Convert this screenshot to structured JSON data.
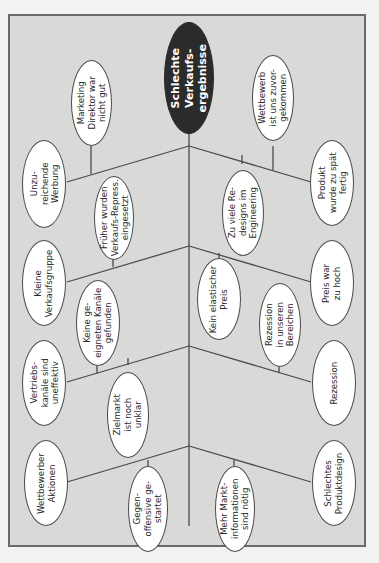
{
  "diagram": {
    "type": "fishbone",
    "orientation": "rotated-90",
    "colors": {
      "frame_fill": "#d9d9d7",
      "frame_border": "#6a6a6a",
      "node_fill": "#ffffff",
      "head_fill": "#2b2b2b",
      "line": "#4a4a4a"
    },
    "head": {
      "label": "Schlechte\nVerkaufs-\nergebnisse"
    },
    "branches": [
      {
        "side": "left",
        "cause": "Unzu-\nreichende\nWerbung",
        "sub_causes": [
          "Marketing\nDirektor war\nnicht gut",
          "Früher wurden\nVerkaufs-Repress.\neingesetzt"
        ]
      },
      {
        "side": "left",
        "cause": "Kleine\nVerkaufsgruppe",
        "sub_causes": [
          "Keine ge-\neigneten Kanäle\ngefunden"
        ]
      },
      {
        "side": "left",
        "cause": "Vertriebs-\nkanäle sind\nuneffektiv",
        "sub_causes": [
          "Keine ge-\neigneten Kanäle\ngefunden",
          "Zielmarkt\nist noch\nunklar"
        ]
      },
      {
        "side": "left",
        "cause": "Wettbewerber\nAktionen",
        "sub_causes": [
          "Gegen-\noffensive ge-\nstartet"
        ]
      },
      {
        "side": "right",
        "cause": "Produkt\nwurde zu spät\nfertig",
        "sub_causes": [
          "Wettbewerb\nist uns zuvor-\ngekommen",
          "Zu viele Re-\ndesigns im\nEngineering"
        ]
      },
      {
        "side": "right",
        "cause": "Preis war\nzu hoch",
        "sub_causes": [
          "Kein elastischer\nPreis"
        ]
      },
      {
        "side": "right",
        "cause": "Rezession",
        "sub_causes": [
          "Rezession\nin unseren\nBereichen"
        ]
      },
      {
        "side": "right",
        "cause": "Schlechtes\nProduktdesign",
        "sub_causes": [
          "Mehr Markt-\ninformationen\nsind nötig"
        ]
      }
    ],
    "nodes": {
      "head": "Schlechte\nVerkaufs-\nergebnisse",
      "unzureichende_werbung": "Unzu-\nreichende\nWerbung",
      "marketing_direktor": "Marketing\nDirektor war\nnicht gut",
      "frueher_verkaufs_repress": "Früher wurden\nVerkaufs-Repress.\neingesetzt",
      "kleine_verkaufsgruppe": "Kleine\nVerkaufsgruppe",
      "keine_kanaele": "Keine ge-\neigneten Kanäle\ngefunden",
      "vertriebskanaele": "Vertriebs-\nkanäle sind\nuneffektiv",
      "zielmarkt": "Zielmarkt\nist noch\nunklar",
      "wettbewerber_aktionen": "Wettbewerber\nAktionen",
      "gegenoffensive": "Gegen-\noffensive ge-\nstartet",
      "wettbewerb_zuvor": "Wettbewerb\nist uns zuvor-\ngekommen",
      "produkt_spaet": "Produkt\nwurde zu spät\nfertig",
      "redesigns": "Zu viele Re-\ndesigns im\nEngineering",
      "kein_elastischer_preis": "Kein elastischer\nPreis",
      "preis_hoch": "Preis war\nzu hoch",
      "rezession_bereiche": "Rezession\nin unseren\nBereichen",
      "rezession": "Rezession",
      "markt_informationen": "Mehr Markt-\ninformationen\nsind nötig",
      "schlechtes_produktdesign": "Schlechtes\nProduktdesign"
    }
  }
}
